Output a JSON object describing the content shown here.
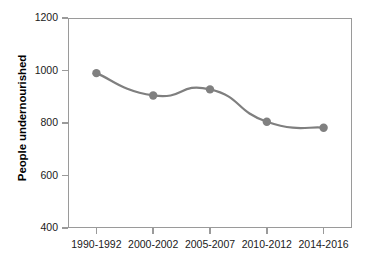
{
  "chart_data": {
    "type": "line",
    "title": "",
    "subtitle": "",
    "xlabel": "",
    "ylabel": "People undernourished",
    "categories": [
      "1990-1992",
      "2000-2002",
      "2005-2007",
      "2010-2012",
      "2014-2016"
    ],
    "values": [
      990,
      905,
      928,
      805,
      782
    ],
    "series": [
      {
        "name": "People undernourished",
        "values": [
          990,
          905,
          928,
          805,
          782
        ]
      }
    ],
    "ylim": [
      400,
      1200
    ],
    "yticks": [
      400,
      600,
      800,
      1000,
      1200
    ],
    "ytick_labels": [
      "400",
      "600",
      "800",
      "1000",
      "1200"
    ],
    "grid": false,
    "legend": false,
    "legend_position": "none",
    "marker": "circle",
    "line_color": "#7f7f7f",
    "marker_color": "#808080",
    "axis_color": "#9a9a9a",
    "background_color": "#ffffff",
    "annotations": []
  }
}
